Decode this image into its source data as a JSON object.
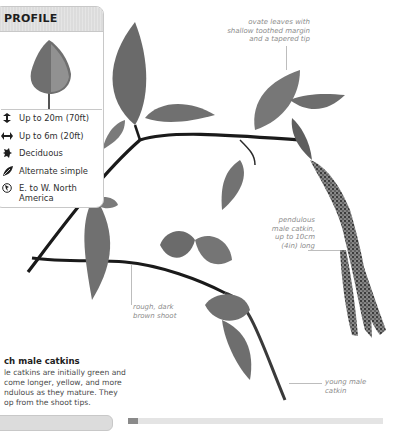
{
  "profile": {
    "title": "PROFILE",
    "tree_icon": "tree-silhouette",
    "facts": [
      {
        "icon": "height-arrows-icon",
        "text": "Up to 20m (70ft)"
      },
      {
        "icon": "spread-arrows-icon",
        "text": "Up to 6m (20ft)"
      },
      {
        "icon": "deciduous-leaf-icon",
        "text": "Deciduous"
      },
      {
        "icon": "leaf-arrangement-icon",
        "text": "Alternate simple"
      },
      {
        "icon": "globe-region-icon",
        "text": "E. to W. North America"
      }
    ]
  },
  "annotations": {
    "leaves": [
      "ovate leaves with",
      "shallow toothed margin",
      "and a tapered tip"
    ],
    "catkin": [
      "pendulous",
      "male catkin,",
      "up to 10cm",
      "(4in) long"
    ],
    "shoot": [
      "rough, dark",
      "brown shoot"
    ],
    "young_catkin": [
      "young male",
      "catkin"
    ]
  },
  "caption": {
    "title": "ch male catkins",
    "lines": [
      "le catkins are initially green and",
      "come longer, yellow, and more",
      "ndulous as they mature. They",
      "op from the shoot tips."
    ]
  },
  "colors": {
    "header_bg": "#dcdcdc",
    "border": "#c8c8c8",
    "annotation_text": "#8c8c8c",
    "stem": "#1a1a1a",
    "leaf": "#6e6e6e"
  }
}
